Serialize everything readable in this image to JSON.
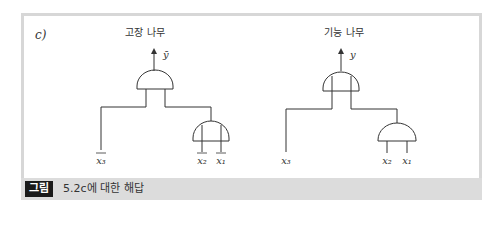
{
  "figure": {
    "part_label": "c)",
    "caption": {
      "badge": "그림",
      "text": "5.2c에 대한 해답"
    },
    "colors": {
      "frame": "#d7d7d7",
      "caption_bar": "#dcdcdc",
      "badge_bg": "#1a1a1a",
      "line": "#333333"
    }
  },
  "fault_tree": {
    "title": "고장 나무",
    "output_label": "ȳ",
    "top_gate": "AND",
    "sub_gate": "AND",
    "inputs": {
      "x3": "x₃",
      "x2": "x₂",
      "x1": "x₁"
    }
  },
  "function_tree": {
    "title": "기능 나무",
    "output_label": "y",
    "top_gate": "AND",
    "sub_gate": "AND",
    "inputs": {
      "x3": "x₃",
      "x2": "x₂",
      "x1": "x₁"
    }
  }
}
